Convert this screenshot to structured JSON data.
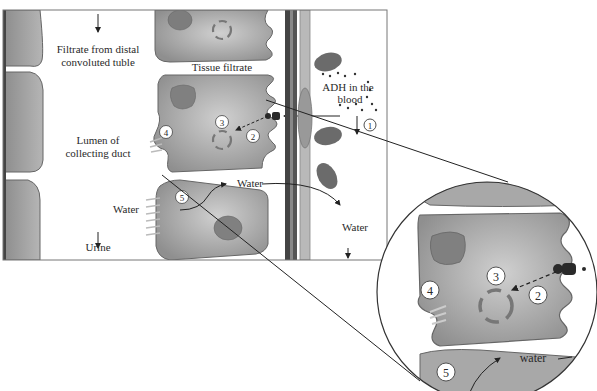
{
  "figure": {
    "labels": {
      "filtrate_line1": "Filtrate from distal",
      "filtrate_line2": "convoluted tuble",
      "tissue_filtrate": "Tissue filtrate",
      "adh_line1": "ADH in the",
      "adh_line2": "blood",
      "lumen_line1": "Lumen of",
      "lumen_line2": "collecting duct",
      "water_left": "Water",
      "water_mid": "Water",
      "water_right": "Water",
      "urine": "Urine",
      "water_zoom": "water"
    },
    "steps": {
      "s1": "1",
      "s2": "2",
      "s3": "3",
      "s4": "4",
      "s5": "5",
      "z2": "2",
      "z3": "3",
      "z4": "4",
      "z5": "5"
    },
    "colors": {
      "cell_fill": "#9a9a9a",
      "cell_light": "#c4c4c4",
      "nucleus": "#7a7a7a",
      "outline": "#555555",
      "rbc": "#6a6a6a",
      "background": "#ffffff"
    }
  }
}
